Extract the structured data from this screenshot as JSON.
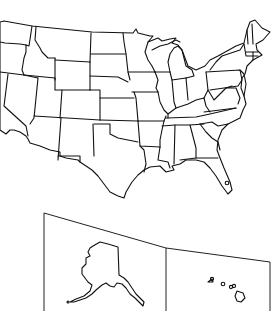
{
  "map": {
    "title": "United States outline map",
    "style": "black line drawing on white",
    "colors": {
      "background": "#ffffff",
      "stroke": "#111111"
    },
    "regions": [
      "contiguous-united-states",
      "alaska-inset",
      "hawaii-inset"
    ],
    "markers": [
      {
        "name": "florida-lake-okeechobee",
        "shape": "small-circle"
      }
    ]
  }
}
